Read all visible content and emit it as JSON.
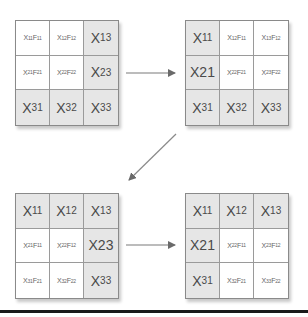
{
  "colors": {
    "shaded_cell": "#e6e6e6",
    "plain_cell": "#ffffff",
    "border": "#8a8a8a",
    "arrow": "#707070",
    "text": "#555555"
  },
  "matrices": [
    {
      "id": "top-left",
      "cells": [
        {
          "main": "X",
          "sub": "11",
          "main2": "F",
          "sub2": "11",
          "style": "small",
          "shaded": false
        },
        {
          "main": "X",
          "sub": "12",
          "main2": "F",
          "sub2": "12",
          "style": "small",
          "shaded": false
        },
        {
          "main": "X",
          "sub": "13",
          "style": "big",
          "shaded": true
        },
        {
          "main": "X",
          "sub": "21",
          "main2": "F",
          "sub2": "21",
          "style": "small",
          "shaded": false
        },
        {
          "main": "X",
          "sub": "22",
          "main2": "F",
          "sub2": "22",
          "style": "small",
          "shaded": false
        },
        {
          "main": "X",
          "sub": "23",
          "style": "big",
          "shaded": true
        },
        {
          "main": "X",
          "sub": "31",
          "style": "big",
          "shaded": true
        },
        {
          "main": "X",
          "sub": "32",
          "style": "big",
          "shaded": true
        },
        {
          "main": "X",
          "sub": "33",
          "style": "big",
          "shaded": true
        }
      ]
    },
    {
      "id": "top-right",
      "cells": [
        {
          "main": "X",
          "sub": "11",
          "style": "big",
          "shaded": true
        },
        {
          "main": "X",
          "sub": "12",
          "main2": "F",
          "sub2": "11",
          "style": "small",
          "shaded": false
        },
        {
          "main": "X",
          "sub": "13",
          "main2": "F",
          "sub2": "12",
          "style": "small",
          "shaded": false
        },
        {
          "main": "X21",
          "sub": "",
          "style": "big",
          "shaded": true
        },
        {
          "main": "X",
          "sub": "22",
          "main2": "F",
          "sub2": "21",
          "style": "small",
          "shaded": false
        },
        {
          "main": "X",
          "sub": "23",
          "main2": "F",
          "sub2": "22",
          "style": "small",
          "shaded": false
        },
        {
          "main": "X",
          "sub": "31",
          "style": "big",
          "shaded": true
        },
        {
          "main": "X",
          "sub": "32",
          "style": "big",
          "shaded": true
        },
        {
          "main": "X",
          "sub": "33",
          "style": "big",
          "shaded": true
        }
      ]
    },
    {
      "id": "bottom-left",
      "cells": [
        {
          "main": "X",
          "sub": "11",
          "style": "big",
          "shaded": true
        },
        {
          "main": "X",
          "sub": "12",
          "style": "big",
          "shaded": true
        },
        {
          "main": "X",
          "sub": "13",
          "style": "big",
          "shaded": true
        },
        {
          "main": "X",
          "sub": "21",
          "main2": "F",
          "sub2": "11",
          "style": "small",
          "shaded": false
        },
        {
          "main": "X",
          "sub": "22",
          "main2": "F",
          "sub2": "12",
          "style": "small",
          "shaded": false
        },
        {
          "main": "X23",
          "sub": "",
          "style": "big",
          "shaded": true
        },
        {
          "main": "X",
          "sub": "31",
          "main2": "F",
          "sub2": "21",
          "style": "small",
          "shaded": false
        },
        {
          "main": "X",
          "sub": "32",
          "main2": "F",
          "sub2": "22",
          "style": "small",
          "shaded": false
        },
        {
          "main": "X",
          "sub": "33",
          "style": "big",
          "shaded": true
        }
      ]
    },
    {
      "id": "bottom-right",
      "cells": [
        {
          "main": "X",
          "sub": "11",
          "style": "big",
          "shaded": true
        },
        {
          "main": "X",
          "sub": "12",
          "style": "big",
          "shaded": true
        },
        {
          "main": "X",
          "sub": "13",
          "style": "big",
          "shaded": true
        },
        {
          "main": "X21",
          "sub": "",
          "style": "big",
          "shaded": true
        },
        {
          "main": "X",
          "sub": "22",
          "main2": "F",
          "sub2": "11",
          "style": "small",
          "shaded": false
        },
        {
          "main": "X",
          "sub": "23",
          "main2": "F",
          "sub2": "12",
          "style": "small",
          "shaded": false
        },
        {
          "main": "X",
          "sub": "31",
          "style": "big",
          "shaded": true
        },
        {
          "main": "X",
          "sub": "32",
          "main2": "F",
          "sub2": "21",
          "style": "small",
          "shaded": false
        },
        {
          "main": "X",
          "sub": "33",
          "main2": "F",
          "sub2": "22",
          "style": "small",
          "shaded": false
        }
      ]
    }
  ],
  "arrows": [
    {
      "from": "top-left",
      "to": "top-right",
      "direction": "right"
    },
    {
      "from": "top-right",
      "to": "bottom-left",
      "direction": "down-left"
    },
    {
      "from": "bottom-left",
      "to": "bottom-right",
      "direction": "right"
    }
  ]
}
